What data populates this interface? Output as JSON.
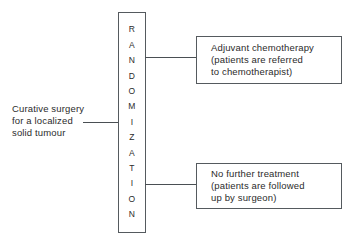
{
  "diagram": {
    "background_color": "#ffffff",
    "line_color": "#4a4f53",
    "border_color": "#555a5e",
    "text_color": "#2b2b2b",
    "entry": {
      "name": "curative-surgery-label",
      "lines": [
        "Curative surgery",
        "for a localized",
        "solid tumour"
      ]
    },
    "randomization": {
      "label": "RANDOMIZATION",
      "letters": [
        "R",
        "A",
        "N",
        "D",
        "O",
        "M",
        "I",
        "Z",
        "A",
        "T",
        "I",
        "O",
        "N"
      ]
    },
    "arms": [
      {
        "name": "adjuvant-chemotherapy-arm",
        "lines": [
          "Adjuvant chemotherapy",
          "(patients are referred",
          "to chemotherapist)"
        ]
      },
      {
        "name": "no-further-treatment-arm",
        "lines": [
          "No further treatment",
          "(patients are followed",
          "up by surgeon)"
        ]
      }
    ]
  }
}
